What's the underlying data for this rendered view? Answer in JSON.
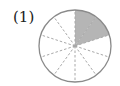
{
  "problem": {
    "label": "(1)"
  },
  "diagram": {
    "type": "fraction-circle",
    "total_sectors": 10,
    "shaded_sectors": 2,
    "shaded_start": "12 o'clock, clockwise",
    "fraction": "2/10",
    "colors": {
      "shade": "#b5b5b5",
      "outline": "#8a8a8a",
      "dividers": "#a8a8a8"
    }
  }
}
